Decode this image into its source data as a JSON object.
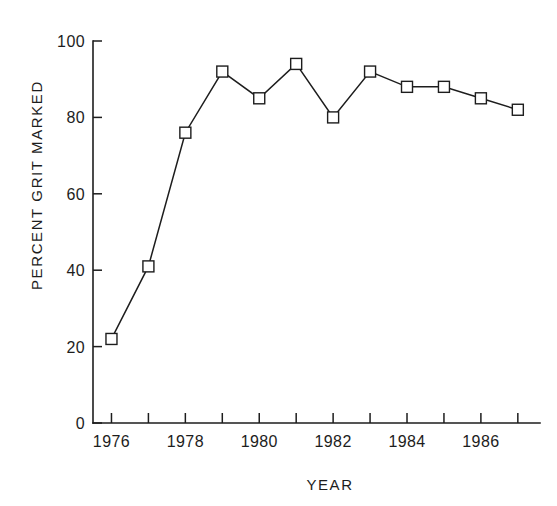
{
  "chart_data": {
    "type": "line",
    "title": "",
    "subtitle": "",
    "xlabel": "YEAR",
    "ylabel": "PERCENT GRIT MARKED",
    "x": [
      1976,
      1977,
      1978,
      1979,
      1980,
      1981,
      1982,
      1983,
      1984,
      1985,
      1986,
      1987
    ],
    "values": [
      22,
      41,
      76,
      92,
      85,
      94,
      80,
      92,
      88,
      88,
      85,
      82
    ],
    "series": [
      {
        "name": "Percent grit marked",
        "values": [
          22,
          41,
          76,
          92,
          85,
          94,
          80,
          92,
          88,
          88,
          85,
          82
        ]
      }
    ],
    "xlim": [
      1975.5,
      1987.6
    ],
    "ylim": [
      0,
      100
    ],
    "xticks": [
      1976,
      1977,
      1978,
      1979,
      1980,
      1981,
      1982,
      1983,
      1984,
      1985,
      1986,
      1987
    ],
    "xtick_labels": [
      "1976",
      "",
      "1978",
      "",
      "1980",
      "",
      "1982",
      "",
      "1984",
      "",
      "1986",
      ""
    ],
    "yticks": [
      0,
      20,
      40,
      60,
      80,
      100
    ],
    "ytick_labels": [
      "0",
      "20",
      "40",
      "60",
      "80",
      "100"
    ],
    "grid": false,
    "legend": false,
    "legend_position": "none",
    "marker": "square",
    "line_color": "#1d1d1d",
    "marker_fill": "#ffffff",
    "background_color": "#ffffff",
    "annotations": []
  }
}
